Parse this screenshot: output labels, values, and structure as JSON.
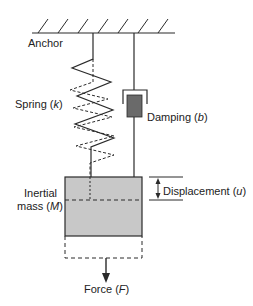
{
  "diagram": {
    "colors": {
      "line": "#2a2a2a",
      "mass_fill": "#c8c8c8",
      "piston_fill": "#6a6a6a",
      "background": "#ffffff"
    },
    "labels": {
      "anchor": "Anchor",
      "spring": {
        "text": "Spring (",
        "symbol": "k",
        "close": ")"
      },
      "damping": {
        "text": "Damping (",
        "symbol": "b",
        "close": ")"
      },
      "mass_line1": "Inertial",
      "mass_line2": {
        "text": "mass (",
        "symbol": "M",
        "close": ")"
      },
      "displacement": {
        "text": "Displacement (",
        "symbol": "u",
        "close": ")"
      },
      "force": {
        "text": "Force (",
        "symbol": "F",
        "close": ")"
      }
    },
    "components": [
      "anchor",
      "spring",
      "damper",
      "inertial-mass",
      "displacement-indicator",
      "force-arrow"
    ]
  }
}
